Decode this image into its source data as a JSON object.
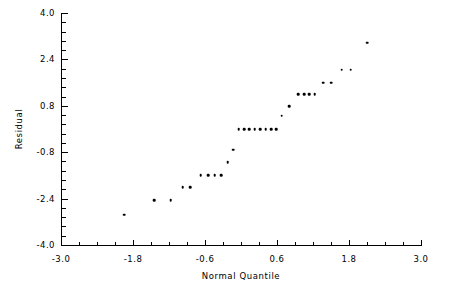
{
  "chart_data": {
    "type": "scatter",
    "title": "",
    "xlabel": "Normal Quantile",
    "ylabel": "Residual",
    "xlim": [
      -3.0,
      3.0
    ],
    "ylim": [
      -4.0,
      4.0
    ],
    "xticks": [
      "-3.0",
      "-1.8",
      "-0.6",
      "0.6",
      "1.8",
      "3.0"
    ],
    "xtick_values": [
      -3.0,
      -1.8,
      -0.6,
      0.6,
      1.8,
      3.0
    ],
    "yticks": [
      "4.0",
      "2.4",
      "0.8",
      "-0.8",
      "-2.4",
      "-4.0"
    ],
    "ytick_values": [
      4.0,
      2.4,
      0.8,
      -0.8,
      -2.4,
      -4.0
    ],
    "x_minor_per_major": 3,
    "y_minor_per_major": 4,
    "grid": false,
    "legend": false,
    "marker": "dot",
    "marker_color": "#000000",
    "n_points": 25,
    "points": [
      {
        "x": -1.95,
        "y": -2.95
      },
      {
        "x": -1.45,
        "y": -2.45
      },
      {
        "x": -1.17,
        "y": -2.45
      },
      {
        "x": -0.97,
        "y": -2.0
      },
      {
        "x": -0.85,
        "y": -2.0
      },
      {
        "x": -0.67,
        "y": -1.6
      },
      {
        "x": -0.55,
        "y": -1.6
      },
      {
        "x": -0.44,
        "y": -1.6
      },
      {
        "x": -0.33,
        "y": -1.6
      },
      {
        "x": -0.22,
        "y": -1.15
      },
      {
        "x": -0.13,
        "y": -0.72
      },
      {
        "x": -0.04,
        "y": 0.0
      },
      {
        "x": 0.05,
        "y": 0.0
      },
      {
        "x": 0.14,
        "y": 0.0
      },
      {
        "x": 0.23,
        "y": 0.0
      },
      {
        "x": 0.32,
        "y": 0.0
      },
      {
        "x": 0.41,
        "y": 0.0
      },
      {
        "x": 0.5,
        "y": 0.0
      },
      {
        "x": 0.59,
        "y": 0.0
      },
      {
        "x": 0.68,
        "y": 0.45
      },
      {
        "x": 0.8,
        "y": 0.78
      },
      {
        "x": 0.95,
        "y": 1.2
      },
      {
        "x": 1.05,
        "y": 1.2
      },
      {
        "x": 1.14,
        "y": 1.2
      },
      {
        "x": 1.23,
        "y": 1.2
      },
      {
        "x": 1.37,
        "y": 1.6
      },
      {
        "x": 1.5,
        "y": 1.6
      },
      {
        "x": 1.68,
        "y": 2.05
      },
      {
        "x": 1.83,
        "y": 2.05
      },
      {
        "x": 2.1,
        "y": 2.98
      }
    ]
  },
  "axes": {
    "x_title": "Normal Quantile",
    "y_title": "Residual"
  }
}
